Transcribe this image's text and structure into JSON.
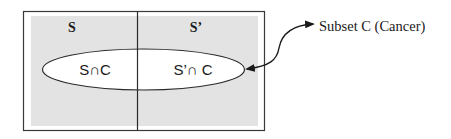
{
  "diagram": {
    "type": "venn",
    "universe": {
      "regions": [
        {
          "id": "S",
          "label": "S"
        },
        {
          "id": "S_prime",
          "label": "S’"
        }
      ]
    },
    "subset": {
      "id": "C",
      "intersections": [
        {
          "id": "S_and_C",
          "label": "S∩C"
        },
        {
          "id": "S_prime_and_C",
          "label": "S’∩ C"
        }
      ],
      "callout_label": "Subset C (Cancer)"
    },
    "colors": {
      "region_fill": "#e3e3e3",
      "outline": "#3a3a3a",
      "ellipse_fill": "#ffffff",
      "text": "#1a1a1a"
    }
  }
}
